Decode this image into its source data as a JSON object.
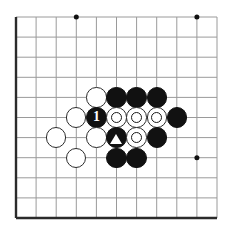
{
  "diagram": {
    "type": "go-board-problem",
    "board": {
      "columns": 11,
      "rows": 11,
      "origin_x": 16,
      "origin_y": 17,
      "spacing": 20.1,
      "line_color": "#9a9a9a",
      "border_color": "#2b2b2b",
      "background_color": "#ffffff",
      "stone_radius": 10.2
    },
    "star_points": [
      {
        "name": "star-point-top-left",
        "col": 3,
        "row": 0
      },
      {
        "name": "star-point-top-right",
        "col": 9,
        "row": 0
      },
      {
        "name": "star-point-bottom-left",
        "col": 3,
        "row": 7
      },
      {
        "name": "star-point-bottom-right",
        "col": 9,
        "row": 7
      }
    ],
    "stones": [
      {
        "name": "white-stone-c4-r4",
        "color": "white",
        "col": 4,
        "row": 4,
        "mark": "none",
        "label": ""
      },
      {
        "name": "black-stone-c5-r4",
        "color": "black",
        "col": 5,
        "row": 4,
        "mark": "none",
        "label": ""
      },
      {
        "name": "black-stone-c6-r4",
        "color": "black",
        "col": 6,
        "row": 4,
        "mark": "none",
        "label": ""
      },
      {
        "name": "black-stone-c7-r4",
        "color": "black",
        "col": 7,
        "row": 4,
        "mark": "none",
        "label": ""
      },
      {
        "name": "white-stone-c3-r5",
        "color": "white",
        "col": 3,
        "row": 5,
        "mark": "none",
        "label": ""
      },
      {
        "name": "black-stone-move-1",
        "color": "black",
        "col": 4,
        "row": 5,
        "mark": "none",
        "label": "1"
      },
      {
        "name": "white-stone-marked-circle-c5-r5",
        "color": "white",
        "col": 5,
        "row": 5,
        "mark": "circle",
        "label": ""
      },
      {
        "name": "white-stone-marked-circle-c6-r5",
        "color": "white",
        "col": 6,
        "row": 5,
        "mark": "circle",
        "label": ""
      },
      {
        "name": "white-stone-marked-circle-c7-r5",
        "color": "white",
        "col": 7,
        "row": 5,
        "mark": "circle",
        "label": ""
      },
      {
        "name": "black-stone-c8-r5",
        "color": "black",
        "col": 8,
        "row": 5,
        "mark": "none",
        "label": ""
      },
      {
        "name": "white-stone-c2-r6",
        "color": "white",
        "col": 2,
        "row": 6,
        "mark": "none",
        "label": ""
      },
      {
        "name": "white-stone-c4-r6",
        "color": "white",
        "col": 4,
        "row": 6,
        "mark": "none",
        "label": ""
      },
      {
        "name": "black-stone-marked-triangle-c5-r6",
        "color": "black",
        "col": 5,
        "row": 6,
        "mark": "triangle",
        "label": ""
      },
      {
        "name": "white-stone-marked-circle-c6-r6",
        "color": "white",
        "col": 6,
        "row": 6,
        "mark": "circle",
        "label": ""
      },
      {
        "name": "black-stone-c7-r6",
        "color": "black",
        "col": 7,
        "row": 6,
        "mark": "none",
        "label": ""
      },
      {
        "name": "white-stone-c3-r7",
        "color": "white",
        "col": 3,
        "row": 7,
        "mark": "none",
        "label": ""
      },
      {
        "name": "black-stone-c5-r7",
        "color": "black",
        "col": 5,
        "row": 7,
        "mark": "none",
        "label": ""
      },
      {
        "name": "black-stone-c6-r7",
        "color": "black",
        "col": 6,
        "row": 7,
        "mark": "none",
        "label": ""
      }
    ]
  }
}
